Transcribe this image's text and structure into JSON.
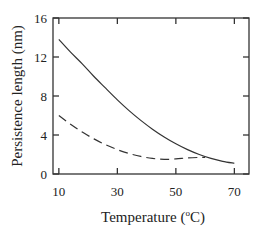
{
  "chart_data": {
    "type": "line",
    "title": "",
    "xlabel": "Temperature (",
    "xlabel_sup": "o",
    "xlabel_suffix": "C)",
    "ylabel": "Persistence length (nm)",
    "xlim": [
      8,
      75
    ],
    "ylim": [
      0,
      16
    ],
    "xticks": [
      10,
      30,
      50,
      70
    ],
    "yticks": [
      0,
      4,
      8,
      12,
      16
    ],
    "grid": false,
    "legend": null,
    "series": [
      {
        "name": "solid",
        "style": "solid",
        "x": [
          10,
          14,
          18,
          22,
          26,
          30,
          34,
          38,
          42,
          46,
          50,
          54,
          58,
          62,
          66,
          70
        ],
        "y": [
          13.8,
          12.5,
          11.3,
          10.0,
          8.8,
          7.6,
          6.5,
          5.5,
          4.6,
          3.8,
          3.1,
          2.5,
          2.0,
          1.6,
          1.3,
          1.1
        ]
      },
      {
        "name": "dashed",
        "style": "dashed",
        "x": [
          10,
          14,
          18,
          22,
          26,
          30,
          34,
          38,
          42,
          46,
          50,
          54,
          58,
          60
        ],
        "y": [
          6.0,
          5.1,
          4.3,
          3.6,
          3.0,
          2.5,
          2.1,
          1.8,
          1.6,
          1.5,
          1.55,
          1.65,
          1.7,
          1.7
        ]
      }
    ]
  }
}
